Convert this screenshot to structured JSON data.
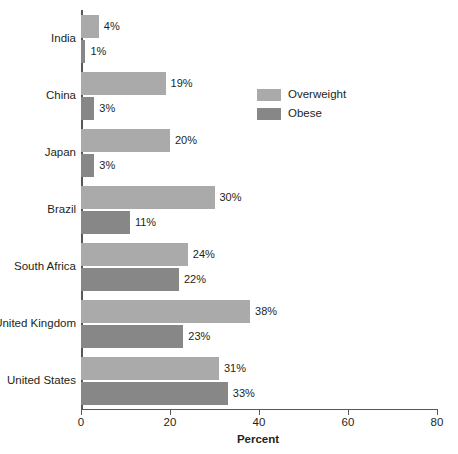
{
  "chart_data": {
    "type": "bar",
    "orientation": "horizontal",
    "title": "",
    "xlabel": "Percent",
    "ylabel": "",
    "xlim": [
      0,
      80
    ],
    "xticks": [
      0,
      20,
      40,
      60,
      80
    ],
    "xtick_labels": [
      "0",
      "20",
      "40",
      "60",
      "80"
    ],
    "grid": false,
    "legend_position": "upper right",
    "categories": [
      "India",
      "China",
      "Japan",
      "Brazil",
      "South Africa",
      "United Kingdom",
      "United States"
    ],
    "series": [
      {
        "name": "Overweight",
        "color": "#aaaaaa",
        "values": [
          4,
          19,
          20,
          30,
          24,
          38,
          31
        ],
        "labels": [
          "4%",
          "19%",
          "20%",
          "30%",
          "24%",
          "38%",
          "31%"
        ]
      },
      {
        "name": "Obese",
        "color": "#878787",
        "values": [
          1,
          3,
          3,
          11,
          22,
          23,
          33
        ],
        "labels": [
          "1%",
          "3%",
          "3%",
          "11%",
          "22%",
          "23%",
          "33%"
        ]
      }
    ]
  },
  "legend": {
    "items": [
      {
        "label": "Overweight",
        "swatch": "overweight"
      },
      {
        "label": "Obese",
        "swatch": "obese"
      }
    ]
  },
  "axis": {
    "x_title": "Percent"
  }
}
